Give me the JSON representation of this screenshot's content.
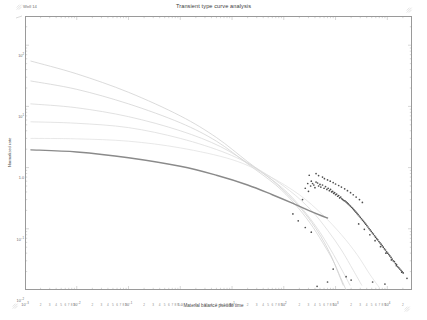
{
  "title": "Transient type curve analysis",
  "legend": {
    "marker": "line-swatch",
    "label": "Well 14"
  },
  "axes": {
    "x": {
      "title": "Material balance pseudo time",
      "major_labels": [
        "10-3",
        "10-2",
        "10-1",
        "1.0",
        "101",
        "102",
        "103",
        "104"
      ],
      "minor_labels": [
        "2",
        "3",
        "4",
        "5",
        "6",
        "7",
        "8",
        "9"
      ],
      "scale": "log",
      "range": [
        0.001,
        30000
      ]
    },
    "y": {
      "title": "Normalized rate",
      "major_labels": [
        "102",
        "101",
        "1.0",
        "10-1",
        "10-2"
      ],
      "scale": "log",
      "range": [
        0.01,
        300
      ]
    }
  },
  "colors": {
    "frame": "#9a9a9a",
    "type_curve": "#c9c9c9",
    "match_curve": "#8a8a8a",
    "scatter": "#4f4f4f",
    "text": "#5a5a5a"
  },
  "chart_data": {
    "type": "line",
    "title": "Transient type curve analysis",
    "xlabel": "Material balance pseudo time",
    "ylabel": "Normalized rate",
    "xscale": "log",
    "yscale": "log",
    "xlim": [
      0.001,
      30000
    ],
    "ylim": [
      0.01,
      300
    ],
    "grid": false,
    "legend": [
      "Well 14"
    ],
    "series": [
      {
        "name": "type-curve-1",
        "kind": "line",
        "color": "#cccccc",
        "points": [
          [
            0.0013,
            55
          ],
          [
            0.01,
            34
          ],
          [
            0.1,
            17
          ],
          [
            1.0,
            7.0
          ],
          [
            5,
            3.1
          ],
          [
            20,
            1.25
          ],
          [
            60,
            0.62
          ],
          [
            150,
            0.3
          ],
          [
            300,
            0.15
          ],
          [
            520,
            0.075
          ],
          [
            800,
            0.038
          ],
          [
            1100,
            0.02
          ],
          [
            1400,
            0.012
          ]
        ]
      },
      {
        "name": "type-curve-2",
        "kind": "line",
        "color": "#cfcfcf",
        "points": [
          [
            0.0013,
            26
          ],
          [
            0.01,
            19
          ],
          [
            0.1,
            11
          ],
          [
            1.0,
            5.4
          ],
          [
            5,
            2.7
          ],
          [
            20,
            1.15
          ],
          [
            70,
            0.52
          ],
          [
            160,
            0.26
          ],
          [
            320,
            0.125
          ],
          [
            560,
            0.06
          ],
          [
            900,
            0.03
          ],
          [
            1250,
            0.016
          ],
          [
            1600,
            0.01
          ]
        ]
      },
      {
        "name": "type-curve-3",
        "kind": "line",
        "color": "#d4d4d4",
        "points": [
          [
            0.0013,
            11
          ],
          [
            0.01,
            9.5
          ],
          [
            0.1,
            6.8
          ],
          [
            1.0,
            4.0
          ],
          [
            6,
            2.2
          ],
          [
            25,
            1.05
          ],
          [
            90,
            0.48
          ],
          [
            220,
            0.22
          ],
          [
            450,
            0.1
          ],
          [
            800,
            0.046
          ],
          [
            1300,
            0.022
          ],
          [
            1900,
            0.012
          ]
        ]
      },
      {
        "name": "type-curve-4",
        "kind": "line",
        "color": "#d9d9d9",
        "points": [
          [
            0.0013,
            5.6
          ],
          [
            0.01,
            5.3
          ],
          [
            0.1,
            4.5
          ],
          [
            1.0,
            3.0
          ],
          [
            8,
            1.7
          ],
          [
            35,
            0.9
          ],
          [
            130,
            0.42
          ],
          [
            340,
            0.2
          ],
          [
            700,
            0.095
          ],
          [
            1300,
            0.045
          ],
          [
            2200,
            0.021
          ],
          [
            3200,
            0.012
          ]
        ]
      },
      {
        "name": "type-curve-5",
        "kind": "line",
        "color": "#dedede",
        "points": [
          [
            0.0013,
            3.0
          ],
          [
            0.01,
            2.95
          ],
          [
            0.1,
            2.7
          ],
          [
            1.0,
            2.1
          ],
          [
            10,
            1.35
          ],
          [
            50,
            0.74
          ],
          [
            200,
            0.36
          ],
          [
            560,
            0.17
          ],
          [
            1300,
            0.08
          ],
          [
            2600,
            0.038
          ],
          [
            4600,
            0.018
          ],
          [
            7000,
            0.011
          ]
        ]
      },
      {
        "name": "match-curve",
        "kind": "line",
        "color": "#8a8a8a",
        "width": 1.4,
        "points": [
          [
            0.0013,
            1.95
          ],
          [
            0.01,
            1.8
          ],
          [
            0.1,
            1.45
          ],
          [
            1.0,
            1.05
          ],
          [
            5,
            0.75
          ],
          [
            20,
            0.52
          ],
          [
            60,
            0.36
          ],
          [
            150,
            0.26
          ],
          [
            300,
            0.2
          ],
          [
            520,
            0.165
          ],
          [
            700,
            0.15
          ]
        ]
      },
      {
        "name": "well-14-data",
        "kind": "scatter",
        "color": "#4f4f4f",
        "points": [
          [
            230,
            0.3
          ],
          [
            260,
            0.46
          ],
          [
            290,
            0.55
          ],
          [
            300,
            0.41
          ],
          [
            330,
            0.5
          ],
          [
            340,
            0.6
          ],
          [
            360,
            0.55
          ],
          [
            380,
            0.52
          ],
          [
            400,
            0.47
          ],
          [
            420,
            0.58
          ],
          [
            450,
            0.56
          ],
          [
            470,
            0.5
          ],
          [
            500,
            0.53
          ],
          [
            520,
            0.48
          ],
          [
            560,
            0.52
          ],
          [
            600,
            0.46
          ],
          [
            640,
            0.49
          ],
          [
            680,
            0.44
          ],
          [
            720,
            0.46
          ],
          [
            760,
            0.42
          ],
          [
            800,
            0.44
          ],
          [
            840,
            0.4
          ],
          [
            880,
            0.41
          ],
          [
            920,
            0.38
          ],
          [
            960,
            0.39
          ],
          [
            1000,
            0.36
          ],
          [
            1050,
            0.37
          ],
          [
            1100,
            0.34
          ],
          [
            1150,
            0.35
          ],
          [
            1200,
            0.32
          ],
          [
            1260,
            0.33
          ],
          [
            1320,
            0.31
          ],
          [
            1380,
            0.3
          ],
          [
            1450,
            0.29
          ],
          [
            1520,
            0.285
          ],
          [
            1600,
            0.275
          ],
          [
            1680,
            0.265
          ],
          [
            1760,
            0.255
          ],
          [
            1850,
            0.245
          ],
          [
            1940,
            0.235
          ],
          [
            2040,
            0.225
          ],
          [
            2140,
            0.215
          ],
          [
            2250,
            0.205
          ],
          [
            2360,
            0.196
          ],
          [
            2480,
            0.187
          ],
          [
            2600,
            0.178
          ],
          [
            2730,
            0.17
          ],
          [
            2870,
            0.162
          ],
          [
            3010,
            0.154
          ],
          [
            3160,
            0.146
          ],
          [
            3320,
            0.139
          ],
          [
            3490,
            0.132
          ],
          [
            3660,
            0.125
          ],
          [
            3840,
            0.119
          ],
          [
            4030,
            0.113
          ],
          [
            4230,
            0.107
          ],
          [
            4440,
            0.101
          ],
          [
            4660,
            0.096
          ],
          [
            4890,
            0.091
          ],
          [
            5130,
            0.086
          ],
          [
            5390,
            0.082
          ],
          [
            5660,
            0.077
          ],
          [
            5940,
            0.073
          ],
          [
            6240,
            0.069
          ],
          [
            6550,
            0.066
          ],
          [
            6880,
            0.062
          ],
          [
            7220,
            0.059
          ],
          [
            7580,
            0.056
          ],
          [
            7960,
            0.053
          ],
          [
            8360,
            0.05
          ],
          [
            8780,
            0.047
          ],
          [
            9220,
            0.045
          ],
          [
            9680,
            0.042
          ],
          [
            10200,
            0.04
          ],
          [
            10700,
            0.038
          ],
          [
            11200,
            0.036
          ],
          [
            11800,
            0.034
          ],
          [
            12400,
            0.032
          ],
          [
            13000,
            0.03
          ],
          [
            13700,
            0.029
          ],
          [
            14400,
            0.027
          ],
          [
            15100,
            0.026
          ],
          [
            15900,
            0.024
          ],
          [
            16700,
            0.023
          ],
          [
            17500,
            0.022
          ],
          [
            18400,
            0.021
          ],
          [
            19300,
            0.02
          ],
          [
            20300,
            0.019
          ],
          [
            150,
            0.175
          ],
          [
            190,
            0.135
          ],
          [
            310,
            0.75
          ],
          [
            420,
            0.8
          ],
          [
            470,
            0.74
          ],
          [
            560,
            0.7
          ],
          [
            610,
            0.66
          ],
          [
            700,
            0.63
          ],
          [
            790,
            0.6
          ],
          [
            900,
            0.57
          ],
          [
            1000,
            0.54
          ],
          [
            1150,
            0.51
          ],
          [
            1300,
            0.48
          ],
          [
            1500,
            0.45
          ],
          [
            1700,
            0.42
          ],
          [
            1950,
            0.39
          ],
          [
            2200,
            0.36
          ],
          [
            2500,
            0.33
          ],
          [
            2900,
            0.3
          ],
          [
            3300,
            0.27
          ],
          [
            2800,
            0.12
          ],
          [
            3600,
            0.098
          ],
          [
            4600,
            0.08
          ],
          [
            5800,
            0.064
          ],
          [
            7400,
            0.051
          ],
          [
            9400,
            0.04
          ],
          [
            12000,
            0.031
          ],
          [
            15000,
            0.025
          ],
          [
            19000,
            0.0195
          ],
          [
            24000,
            0.0155
          ],
          [
            260,
            0.105
          ],
          [
            340,
            0.088
          ],
          [
            900,
            0.022
          ],
          [
            1600,
            0.0165
          ],
          [
            5200,
            0.0135
          ],
          [
            9000,
            0.0125
          ],
          [
            440,
            0.0115
          ],
          [
            700,
            0.0135
          ],
          [
            2000,
            0.0145
          ]
        ]
      }
    ]
  }
}
